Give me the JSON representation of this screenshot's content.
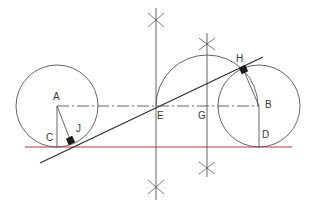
{
  "diagram": {
    "colors": {
      "line": "#555555",
      "tangent": "#2a2a2a",
      "baseline": "#c0304a",
      "marker": "#1a1a1a"
    },
    "labels": {
      "A": "A",
      "B": "B",
      "C": "C",
      "D": "D",
      "E": "E",
      "G": "G",
      "H": "H",
      "J": "J"
    },
    "points": {
      "A": [
        57,
        106
      ],
      "B": [
        259,
        106
      ],
      "C": [
        57,
        147
      ],
      "D": [
        259,
        147
      ],
      "E": [
        156,
        106
      ],
      "G": [
        207,
        106
      ],
      "H": [
        243,
        69
      ],
      "J": [
        71,
        142
      ]
    },
    "circles": [
      {
        "name": "circle-a",
        "cx": 57,
        "cy": 106,
        "r": 41
      },
      {
        "name": "circle-b",
        "cx": 259,
        "cy": 106,
        "r": 41
      }
    ],
    "arc": {
      "cx": 207,
      "cy": 106,
      "r": 51
    }
  }
}
